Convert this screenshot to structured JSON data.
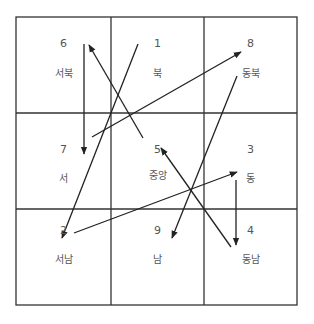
{
  "diagram": {
    "title": "",
    "grid": {
      "rows": 3,
      "cols": 3,
      "x": [
        16,
        111,
        204,
        297
      ],
      "y": [
        17,
        113,
        209,
        305
      ]
    },
    "line_color": "#333333",
    "cells": [
      {
        "row": 0,
        "col": 0,
        "number": "6",
        "name": "서북"
      },
      {
        "row": 0,
        "col": 1,
        "number": "1",
        "name": "북"
      },
      {
        "row": 0,
        "col": 2,
        "number": "8",
        "name": "동북"
      },
      {
        "row": 1,
        "col": 0,
        "number": "7",
        "name": "서"
      },
      {
        "row": 1,
        "col": 1,
        "number": "5",
        "name": "중앙"
      },
      {
        "row": 1,
        "col": 2,
        "number": "3",
        "name": "동"
      },
      {
        "row": 2,
        "col": 0,
        "number": "2",
        "name": "서남"
      },
      {
        "row": 2,
        "col": 1,
        "number": "9",
        "name": "남"
      },
      {
        "row": 2,
        "col": 2,
        "number": "4",
        "name": "동남"
      }
    ],
    "arrows": [
      {
        "from": "1",
        "to": "2",
        "x1": 138,
        "y1": 44,
        "x2": 62,
        "y2": 238
      },
      {
        "from": "2",
        "to": "3",
        "x1": 74,
        "y1": 233,
        "x2": 237,
        "y2": 172
      },
      {
        "from": "3",
        "to": "4",
        "x1": 236,
        "y1": 180,
        "x2": 236,
        "y2": 245
      },
      {
        "from": "4",
        "to": "5",
        "x1": 231,
        "y1": 247,
        "x2": 161,
        "y2": 148
      },
      {
        "from": "5",
        "to": "6",
        "x1": 143,
        "y1": 138,
        "x2": 89,
        "y2": 45
      },
      {
        "from": "6",
        "to": "7",
        "x1": 84,
        "y1": 44,
        "x2": 84,
        "y2": 154
      },
      {
        "from": "7",
        "to": "8",
        "x1": 92,
        "y1": 137,
        "x2": 241,
        "y2": 52
      },
      {
        "from": "8",
        "to": "9",
        "x1": 237,
        "y1": 76,
        "x2": 172,
        "y2": 238
      }
    ]
  }
}
